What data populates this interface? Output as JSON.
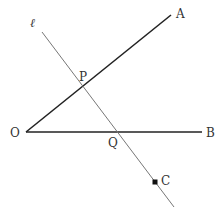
{
  "diagram": {
    "labels": {
      "line": "ℓ",
      "A": "A",
      "B": "B",
      "O": "O",
      "P": "P",
      "Q": "Q",
      "C": "C"
    },
    "points": {
      "O": [
        26,
        132
      ],
      "A": [
        171,
        15
      ],
      "B": [
        202,
        132
      ],
      "P": [
        83,
        87
      ],
      "Q": [
        118,
        132
      ],
      "C": [
        155,
        182
      ],
      "l_start": [
        42,
        32
      ],
      "l_end": [
        174,
        207
      ]
    },
    "colors": {
      "ray": "#222222",
      "line_l": "#777777",
      "label": "#333333"
    }
  }
}
